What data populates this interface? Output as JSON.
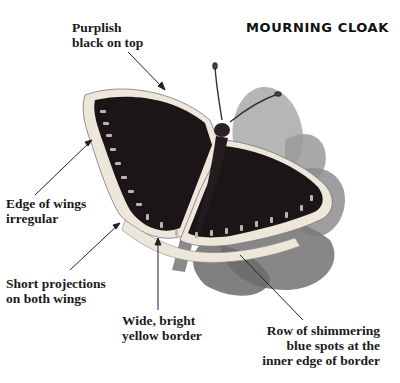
{
  "title": "MOURNING CLOAK",
  "labels": {
    "top": {
      "line1": "Purplish",
      "line2": "black on top"
    },
    "edge": {
      "line1": "Edge of wings",
      "line2": "irregular"
    },
    "projections": {
      "line1": "Short projections",
      "line2": "on both wings"
    },
    "border": {
      "line1": "Wide, bright",
      "line2": "yellow border"
    },
    "spots": {
      "line1": "Row of shimmering",
      "line2": "blue spots at the",
      "line3": "inner edge of border"
    }
  },
  "illustration": {
    "subject": "mourning-cloak-butterfly",
    "colors": {
      "wing": "#1b1518",
      "border": "#ece7da",
      "spots": "#b9b6b0",
      "leaf": "#8c8c8c",
      "leaf_dark": "#5e5e5e",
      "arrow": "#222222"
    }
  }
}
